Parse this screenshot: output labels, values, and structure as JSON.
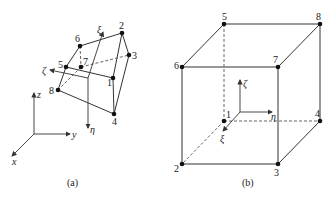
{
  "figure": {
    "panel_a": {
      "caption": "(a)",
      "node_labels": [
        "1",
        "2",
        "3",
        "4",
        "5",
        "6",
        "7",
        "8"
      ],
      "global_axes": {
        "x": "x",
        "y": "y",
        "z": "z"
      },
      "local_axes": {
        "xi": "ξ",
        "eta": "η",
        "zeta": "ζ"
      }
    },
    "panel_b": {
      "caption": "(b)",
      "node_labels": [
        "1",
        "2",
        "3",
        "4",
        "5",
        "6",
        "7",
        "8"
      ],
      "local_axes": {
        "xi": "ξ",
        "eta": "η",
        "zeta": "ζ"
      }
    }
  }
}
